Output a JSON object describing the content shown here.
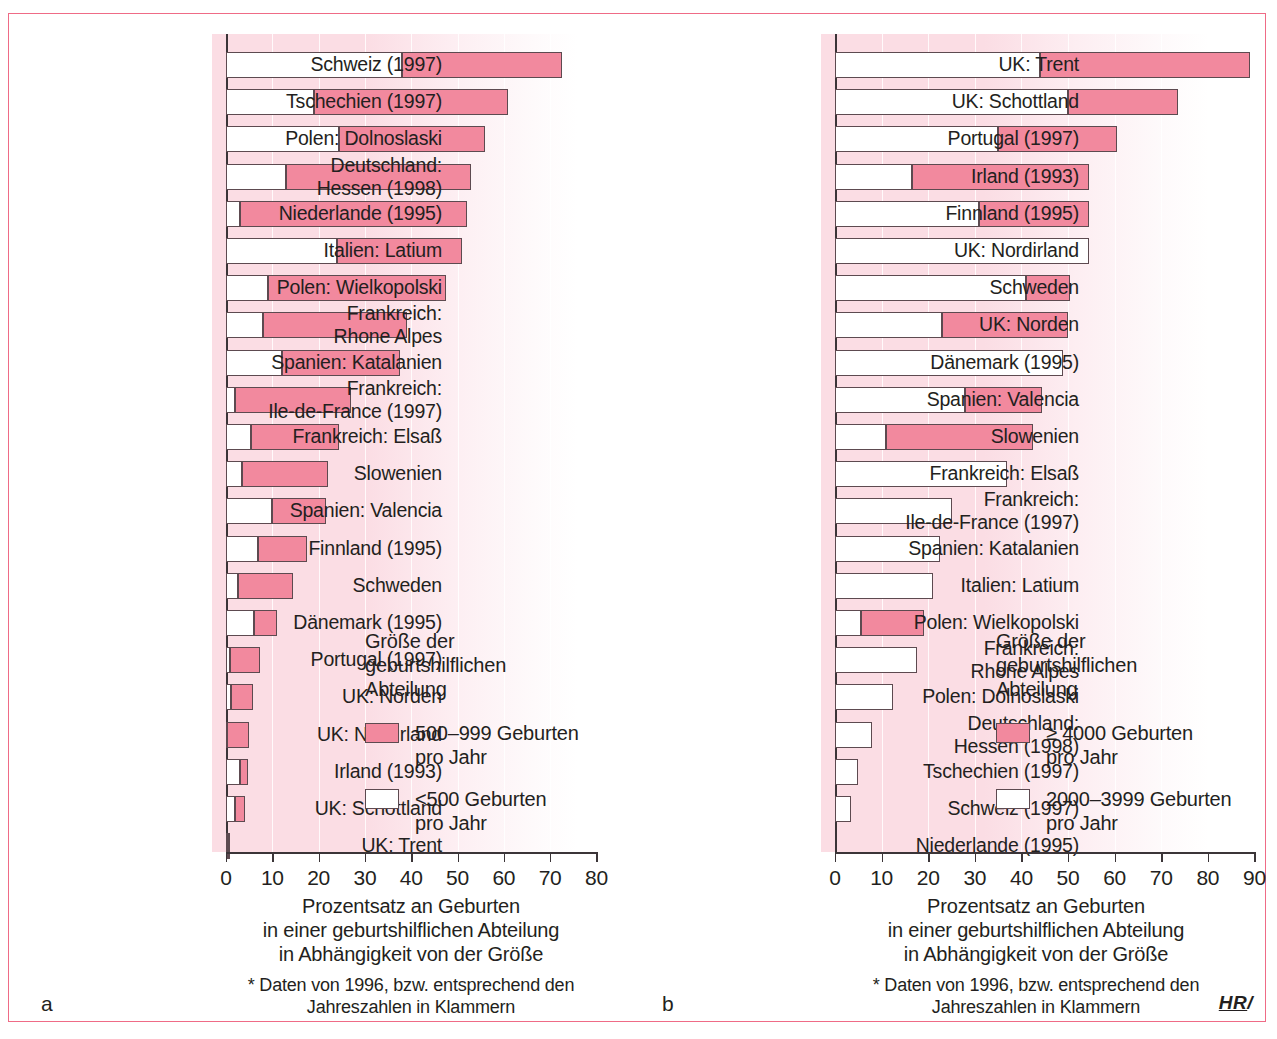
{
  "figure": {
    "credit": "HR",
    "panels": [
      {
        "letter": "a",
        "axis_caption": "Prozentsatz an Geburten\nin einer geburtshilflichen Abteilung\nin Abhängigkeit von der Größe",
        "footnote": "* Daten von 1996, bzw. entsprechend den\nJahreszahlen in Klammern",
        "legend": {
          "title": "Größe der\ngeburtshilflichen\nAbteilung",
          "entries": [
            {
              "swatch": "pink",
              "label": "500–999 Geburten\npro Jahr"
            },
            {
              "swatch": "white",
              "label": "<500 Geburten\npro Jahr"
            }
          ]
        }
      },
      {
        "letter": "b",
        "axis_caption": "Prozentsatz an Geburten\nin einer geburtshilflichen Abteilung\nin Abhängigkeit von der Größe",
        "footnote": "* Daten von 1996, bzw. entsprechend den\nJahreszahlen in Klammern",
        "legend": {
          "title": "Größe der\ngeburtshilflichen\nAbteilung",
          "entries": [
            {
              "swatch": "pink",
              "label": "≥ 4000 Geburten\npro Jahr"
            },
            {
              "swatch": "white",
              "label": "2000–3999 Geburten\npro Jahr"
            }
          ]
        }
      }
    ]
  },
  "chart_data": [
    {
      "panel": "a",
      "type": "bar",
      "orientation": "horizontal",
      "stacked": true,
      "title": "",
      "xlabel": "Prozentsatz an Geburten in einer geburtshilflichen Abteilung in Abhängigkeit von der Größe",
      "ylabel": "",
      "xlim": [
        0,
        80
      ],
      "xticks": [
        0,
        10,
        20,
        30,
        40,
        50,
        60,
        70,
        80
      ],
      "grid": true,
      "legend_position": "inside-right",
      "series": [
        {
          "name": "<500 Geburten pro Jahr",
          "color": "#ffffff"
        },
        {
          "name": "500–999 Geburten pro Jahr",
          "color": "#f2899e"
        }
      ],
      "categories": [
        "Schweiz (1997)",
        "Tschechien (1997)",
        "Polen: Dolnoslaski",
        "Deutschland:\nHessen (1998)",
        "Niederlande (1995)",
        "Italien: Latium",
        "Polen: Wielkopolski",
        "Frankreich:\nRhone Alpes",
        "Spanien: Katalanien",
        "Frankreich:\nIle-de-France (1997)",
        "Frankreich: Elsaß",
        "Slowenien",
        "Spanien: Valencia",
        "Finnland (1995)",
        "Schweden",
        "Dänemark (1995)",
        "Portugal (1997)",
        "UK: Norden",
        "UK: Nordirland",
        "Irland (1993)",
        "UK: Schottland",
        "UK: Trent"
      ],
      "values_under500": [
        38.0,
        19.0,
        24.5,
        13.0,
        3.0,
        24.0,
        9.0,
        8.0,
        12.0,
        2.0,
        5.5,
        3.5,
        10.0,
        7.0,
        2.5,
        6.0,
        0.8,
        1.0,
        0.2,
        3.0,
        2.0,
        0.4
      ],
      "values_500_999": [
        34.5,
        42.0,
        31.5,
        40.0,
        49.0,
        27.0,
        38.5,
        31.0,
        25.5,
        25.0,
        19.0,
        18.5,
        11.5,
        10.5,
        12.0,
        5.0,
        6.5,
        4.8,
        4.8,
        1.8,
        2.2,
        0.4
      ],
      "totals": [
        72.5,
        61.0,
        56.0,
        53.0,
        52.0,
        51.0,
        47.5,
        39.0,
        37.5,
        27.0,
        24.5,
        22.0,
        21.5,
        17.5,
        14.5,
        11.0,
        7.3,
        5.8,
        5.0,
        4.8,
        4.2,
        0.8
      ]
    },
    {
      "panel": "b",
      "type": "bar",
      "orientation": "horizontal",
      "stacked": true,
      "title": "",
      "xlabel": "Prozentsatz an Geburten in einer geburtshilflichen Abteilung in Abhängigkeit von der Größe",
      "ylabel": "",
      "xlim": [
        0,
        90
      ],
      "xticks": [
        0,
        10,
        20,
        30,
        40,
        50,
        60,
        70,
        80,
        90
      ],
      "grid": true,
      "legend_position": "inside-right",
      "series": [
        {
          "name": "2000–3999 Geburten pro Jahr",
          "color": "#ffffff"
        },
        {
          "name": "≥ 4000 Geburten pro Jahr",
          "color": "#f2899e"
        }
      ],
      "categories": [
        "UK: Trent",
        "UK: Schottland",
        "Portugal (1997)",
        "Irland (1993)",
        "Finnland (1995)",
        "UK: Nordirland",
        "Schweden",
        "UK: Norden",
        "Dänemark (1995)",
        "Spanien: Valencia",
        "Slowenien",
        "Frankreich: Elsaß",
        "Frankreich:\nIle-de-France (1997)",
        "Spanien: Katalanien",
        "Italien: Latium",
        "Polen: Wielkopolski",
        "Frankreich:\nRhone Alpes",
        "Polen: Dolnoslaski",
        "Deutschland:\nHessen (1998)",
        "Tschechien (1997)",
        "Schweiz (1997)",
        "Niederlande (1995)"
      ],
      "values_2000_3999": [
        44.0,
        50.0,
        35.0,
        16.5,
        31.0,
        54.5,
        41.0,
        23.0,
        49.0,
        28.0,
        11.0,
        37.0,
        25.0,
        22.5,
        21.0,
        5.5,
        17.5,
        12.5,
        8.0,
        5.0,
        3.5,
        0.0
      ],
      "values_4000plus": [
        45.0,
        23.5,
        25.5,
        38.0,
        23.5,
        0.0,
        9.5,
        27.0,
        0.0,
        16.5,
        31.5,
        0.0,
        0.0,
        0.0,
        0.0,
        13.5,
        0.0,
        0.0,
        0.0,
        0.0,
        0.0,
        0.0
      ],
      "totals": [
        89.0,
        73.5,
        60.5,
        54.5,
        54.5,
        54.5,
        50.5,
        50.0,
        49.0,
        44.5,
        42.5,
        37.0,
        25.0,
        22.5,
        21.0,
        19.0,
        17.5,
        12.5,
        8.0,
        5.0,
        3.5,
        0.0
      ]
    }
  ]
}
